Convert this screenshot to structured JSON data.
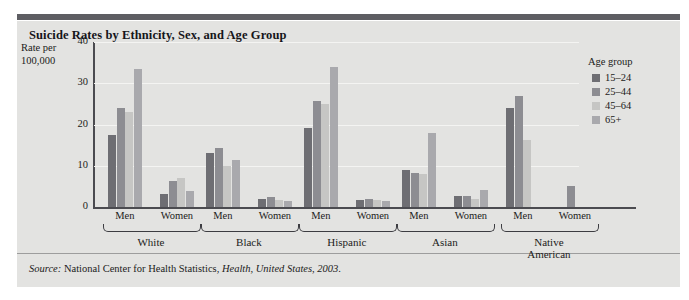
{
  "figure": {
    "title": "Suicide Rates by Ethnicity, Sex, and Age Group",
    "source_prefix": "Source:",
    "source_text": "National Center for Health Statistics,",
    "source_publication": "Health, United States, 2003",
    "source_period": "."
  },
  "axis": {
    "ylabel_line1": "Rate per",
    "ylabel_line2": "100,000",
    "yticks": [
      "0",
      "10",
      "20",
      "30",
      "40"
    ]
  },
  "legend": {
    "title": "Age group",
    "items": [
      {
        "label": "15–24",
        "color": "#6e6e73"
      },
      {
        "label": "25–44",
        "color": "#8d8d92"
      },
      {
        "label": "45–64",
        "color": "#c6c6c4"
      },
      {
        "label": "65+",
        "color": "#a9a9ad"
      }
    ]
  },
  "chart_data": {
    "type": "bar",
    "title": "Suicide Rates by Ethnicity, Sex, and Age Group",
    "xlabel": "",
    "ylabel": "Rate per 100,000",
    "ylim": [
      0,
      40
    ],
    "yticks": [
      0,
      10,
      20,
      30,
      40
    ],
    "grid": true,
    "legend_position": "right",
    "legend_title": "Age group",
    "series": [
      {
        "name": "15–24",
        "color": "#6e6e73"
      },
      {
        "name": "25–44",
        "color": "#8d8d92"
      },
      {
        "name": "45–64",
        "color": "#c6c6c4"
      },
      {
        "name": "65+",
        "color": "#a9a9ad"
      }
    ],
    "ethnicities": [
      "White",
      "Black",
      "Hispanic",
      "Asian",
      "Native American"
    ],
    "sexes": [
      "Men",
      "Women"
    ],
    "groups": [
      {
        "ethnicity": "White",
        "sex": "Men",
        "values": [
          17.5,
          24.0,
          23.0,
          33.5
        ]
      },
      {
        "ethnicity": "White",
        "sex": "Women",
        "values": [
          3.2,
          6.3,
          7.0,
          4.0
        ]
      },
      {
        "ethnicity": "Black",
        "sex": "Men",
        "values": [
          13.0,
          14.2,
          10.0,
          11.5
        ]
      },
      {
        "ethnicity": "Black",
        "sex": "Women",
        "values": [
          2.0,
          2.4,
          1.7,
          1.5
        ]
      },
      {
        "ethnicity": "Hispanic",
        "sex": "Men",
        "values": [
          19.2,
          25.8,
          25.0,
          34.0
        ]
      },
      {
        "ethnicity": "Hispanic",
        "sex": "Women",
        "values": [
          1.8,
          2.0,
          1.6,
          1.5
        ]
      },
      {
        "ethnicity": "Asian",
        "sex": "Men",
        "values": [
          9.0,
          8.3,
          8.0,
          18.0
        ]
      },
      {
        "ethnicity": "Asian",
        "sex": "Women",
        "values": [
          2.7,
          2.7,
          2.0,
          4.1
        ]
      },
      {
        "ethnicity": "Native American",
        "sex": "Men",
        "values": [
          24.0,
          27.0,
          16.2,
          0
        ]
      },
      {
        "ethnicity": "Native American",
        "sex": "Women",
        "values": [
          0,
          5.1,
          0,
          0
        ]
      }
    ]
  },
  "xaxis": {
    "sex_labels": [
      "Men",
      "Women",
      "Men",
      "Women",
      "Men",
      "Women",
      "Men",
      "Women",
      "Men",
      "Women"
    ],
    "ethnicity_labels": [
      "White",
      "Black",
      "Hispanic",
      "Asian",
      "Native\nAmerican"
    ]
  }
}
